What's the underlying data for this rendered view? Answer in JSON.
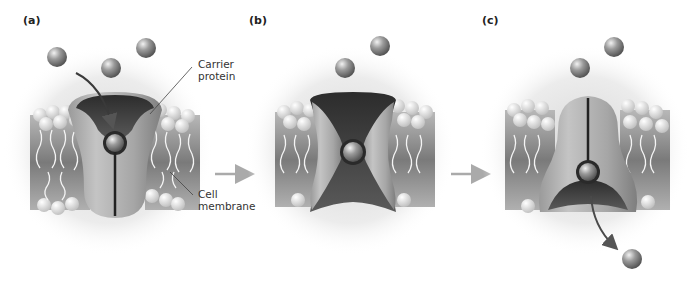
{
  "figure": {
    "panels": [
      {
        "id": "a",
        "label": "(a)",
        "state": "open-top"
      },
      {
        "id": "b",
        "label": "(b)",
        "state": "occluded"
      },
      {
        "id": "c",
        "label": "(c)",
        "state": "open-bottom"
      }
    ],
    "callouts": {
      "carrier_protein": {
        "line1": "Carrier",
        "line2": "protein"
      },
      "cell_membrane": {
        "line1": "Cell",
        "line2": "membrane"
      }
    },
    "icons": {
      "solute": "solute-molecule-icon",
      "transition_arrow": "right-arrow-icon",
      "path_arrow": "curved-arrow-icon"
    },
    "colors": {
      "background": "#ffffff",
      "protein_light": "#b5b5b5",
      "protein_dark": "#3c3c3c",
      "membrane": "#8a8a8a",
      "lipid_head": "#e6e6e6",
      "solute": "#8c8c8c",
      "arrow": "#a8a8a8",
      "path_arrow": "#555555",
      "text": "#222222"
    }
  }
}
